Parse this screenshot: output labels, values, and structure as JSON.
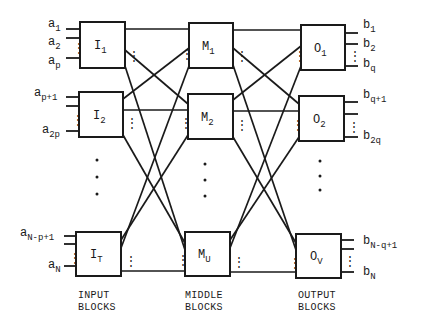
{
  "diagram": {
    "type": "three-stage switching network",
    "columns": {
      "input": {
        "caption_line1": "INPUT",
        "caption_line2": "BLOCKS",
        "blocks": [
          {
            "main": "I",
            "sub": "1",
            "inputs": [
              {
                "main": "a",
                "sub": "1"
              },
              {
                "main": "a",
                "sub": "2"
              },
              {
                "main": "a",
                "sub": "p"
              }
            ]
          },
          {
            "main": "I",
            "sub": "2",
            "inputs": [
              {
                "main": "a",
                "sub": "p+1"
              },
              {
                "main": "a",
                "sub": "2p"
              }
            ]
          },
          {
            "main": "I",
            "sub": "T",
            "inputs": [
              {
                "main": "a",
                "sub": "N-p+1"
              },
              {
                "main": "a",
                "sub": "N"
              }
            ]
          }
        ]
      },
      "middle": {
        "caption_line1": "MIDDLE",
        "caption_line2": "BLOCKS",
        "blocks": [
          {
            "main": "M",
            "sub": "1"
          },
          {
            "main": "M",
            "sub": "2"
          },
          {
            "main": "M",
            "sub": "U"
          }
        ]
      },
      "output": {
        "caption_line1": "OUTPUT",
        "caption_line2": "BLOCKS",
        "blocks": [
          {
            "main": "O",
            "sub": "1",
            "outputs": [
              {
                "main": "b",
                "sub": "1"
              },
              {
                "main": "b",
                "sub": "2"
              },
              {
                "main": "b",
                "sub": "q"
              }
            ]
          },
          {
            "main": "O",
            "sub": "2",
            "outputs": [
              {
                "main": "b",
                "sub": "q+1"
              },
              {
                "main": "b",
                "sub": "2q"
              }
            ]
          },
          {
            "main": "O",
            "sub": "V",
            "outputs": [
              {
                "main": "b",
                "sub": "N-q+1"
              },
              {
                "main": "b",
                "sub": "N"
              }
            ]
          }
        ]
      }
    },
    "connectivity": "each input block connects to every middle block; each middle block connects to every output block",
    "ellipsis": "⋮",
    "colors": {
      "ink": "#1a1a1a",
      "background": "#ffffff"
    }
  }
}
